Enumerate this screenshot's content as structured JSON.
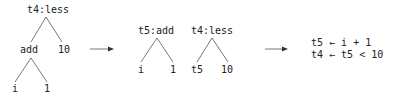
{
  "tree1": {
    "root": "t4:less",
    "add": "add",
    "ten": "10",
    "i": "i",
    "one": "1"
  },
  "tree2": {
    "root": "t5:add",
    "i": "i",
    "one": "1"
  },
  "tree3": {
    "root": "t4:less",
    "t5": "t5",
    "ten": "10"
  },
  "code": {
    "line1": "t5 ← i + 1",
    "line2": "t4 ← t5 < 10"
  },
  "colors": {
    "line": "#555555",
    "text": "#222222"
  }
}
